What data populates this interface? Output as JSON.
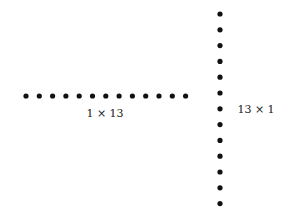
{
  "diagrams": [
    {
      "name": "row-array",
      "rows": 1,
      "cols": 13,
      "label": "1 × 13"
    },
    {
      "name": "column-array",
      "rows": 13,
      "cols": 1,
      "label": "13 × 1"
    }
  ],
  "dot_color": "#111111"
}
